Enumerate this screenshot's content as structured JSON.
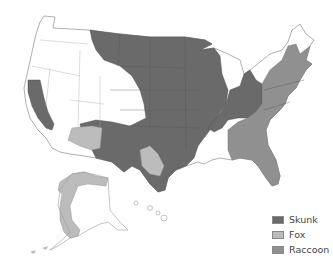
{
  "map": {
    "title": "",
    "region": "United States",
    "colors": {
      "skunk": "#6a6a6a",
      "fox": "#bcbcbc",
      "raccoon": "#909090",
      "none": "#ffffff",
      "border": "#9a9a9a"
    }
  },
  "legend": {
    "items": [
      {
        "label": "Skunk",
        "color": "#6a6a6a"
      },
      {
        "label": "Fox",
        "color": "#bcbcbc"
      },
      {
        "label": "Raccoon",
        "color": "#909090"
      }
    ]
  }
}
